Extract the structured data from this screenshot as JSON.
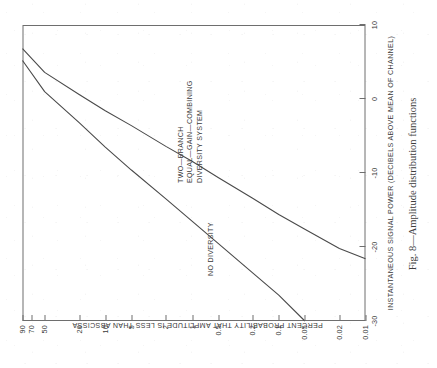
{
  "figure": {
    "caption": "Fig. 8—Amplitude distribution functions",
    "rotation_degrees": -90,
    "background_color": "#ffffff",
    "ink_color": "#3a3a3a",
    "frame_color": "#6e6e6e"
  },
  "chart_data": {
    "type": "line",
    "title": "Fig. 8—Amplitude distribution functions",
    "xlabel": "INSTANTANEOUS SIGNAL POWER (DECIBELS ABOVE MEAN OF CHANNEL)",
    "ylabel": "PERCENT PROBABILITY THAT AMPLITUDE IS LESS THAN ABSCISSA",
    "xlim": [
      -30,
      10
    ],
    "ylim": [
      0.01,
      90
    ],
    "yscale": "probability",
    "grid": false,
    "legend": "annotations-in-plot",
    "xticks": [
      -30,
      -20,
      -10,
      0,
      10
    ],
    "xticklabels": [
      "-30",
      "-20",
      "-10",
      "0",
      "10"
    ],
    "yticks": [
      90,
      70,
      50,
      20,
      10,
      5,
      2,
      1,
      0.5,
      0.2,
      0.1,
      0.05,
      0.02,
      0.01
    ],
    "yticklabels": [
      "90",
      "70",
      "50",
      "20",
      "10",
      "5",
      "2",
      "1",
      "0.5",
      "0.2",
      "0.1",
      "0.05",
      "0.02",
      "0.01"
    ],
    "series": [
      {
        "name": "NO DIVERSITY",
        "label_lines": [
          "NO DIVERSITY"
        ],
        "points": [
          {
            "x": 5.2,
            "y": 90
          },
          {
            "x": 1.0,
            "y": 50
          },
          {
            "x": -3.2,
            "y": 20
          },
          {
            "x": -6.5,
            "y": 10
          },
          {
            "x": -9.6,
            "y": 5
          },
          {
            "x": -13.5,
            "y": 2
          },
          {
            "x": -16.5,
            "y": 1
          },
          {
            "x": -19.5,
            "y": 0.5
          },
          {
            "x": -23.5,
            "y": 0.2
          },
          {
            "x": -26.5,
            "y": 0.1
          },
          {
            "x": -30.0,
            "y": 0.05
          }
        ]
      },
      {
        "name": "TWO-BRANCH EQUAL-GAIN-COMBINING DIVERSITY SYSTEM",
        "label_lines": [
          "TWO—BRANCH",
          "EQUAL—GAIN—COMBINING",
          "DIVERSITY SYSTEM"
        ],
        "points": [
          {
            "x": 6.8,
            "y": 90
          },
          {
            "x": 3.6,
            "y": 50
          },
          {
            "x": 0.6,
            "y": 20
          },
          {
            "x": -1.6,
            "y": 10
          },
          {
            "x": -3.6,
            "y": 5
          },
          {
            "x": -6.4,
            "y": 2
          },
          {
            "x": -8.4,
            "y": 1
          },
          {
            "x": -10.6,
            "y": 0.5
          },
          {
            "x": -13.4,
            "y": 0.2
          },
          {
            "x": -15.6,
            "y": 0.1
          },
          {
            "x": -17.6,
            "y": 0.05
          },
          {
            "x": -20.2,
            "y": 0.02
          },
          {
            "x": -21.6,
            "y": 0.01
          }
        ]
      }
    ],
    "annotations": [
      {
        "text": "NO DIVERSITY",
        "attached_to": "NO DIVERSITY"
      },
      {
        "text": "TWO—BRANCH EQUAL—GAIN—COMBINING DIVERSITY SYSTEM",
        "attached_to": "TWO-BRANCH EQUAL-GAIN-COMBINING DIVERSITY SYSTEM"
      }
    ]
  }
}
